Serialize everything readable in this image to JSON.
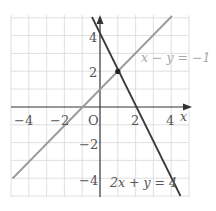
{
  "diagram": {
    "type": "coordinate-plane",
    "origin_label": "O",
    "x_axis_label": "x",
    "y_axis_label": "y",
    "x_ticks": [
      {
        "value": -4,
        "label": "−4"
      },
      {
        "value": -2,
        "label": "−2"
      },
      {
        "value": 2,
        "label": "2"
      },
      {
        "value": 4,
        "label": "4"
      }
    ],
    "y_ticks": [
      {
        "value": 4,
        "label": "4"
      },
      {
        "value": 2,
        "label": "2"
      },
      {
        "value": -2,
        "label": "−2"
      },
      {
        "value": -4,
        "label": "−4"
      }
    ],
    "lines": [
      {
        "equation": "x − y = −1",
        "color": "#9a9a9a"
      },
      {
        "equation": "2x + y = 4",
        "color": "#3a3a3a"
      }
    ],
    "intersection": {
      "x": 1,
      "y": 2
    }
  }
}
